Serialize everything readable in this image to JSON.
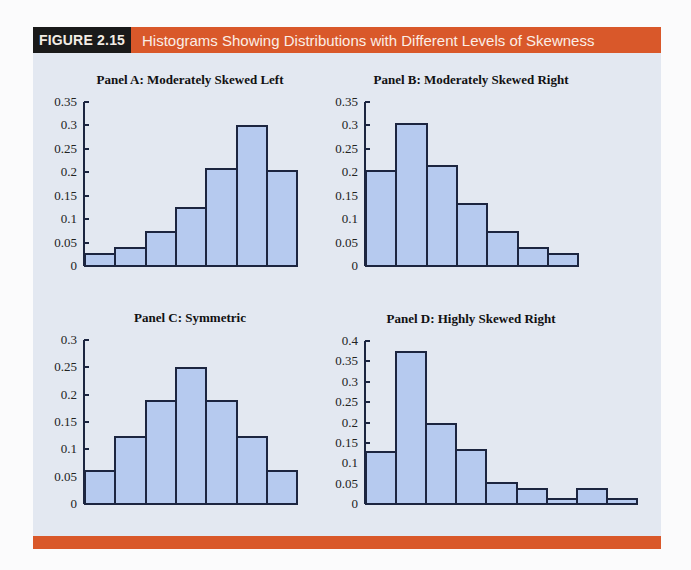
{
  "figure": {
    "label": "FIGURE 2.15",
    "title": "Histograms Showing Distributions with Different Levels of Skewness"
  },
  "colors": {
    "header_orange": "#d9582a",
    "label_black": "#1a1a1a",
    "panel_bg": "#e3e8f1",
    "bar_fill": "#b6caef",
    "bar_border": "#1c2540"
  },
  "chart_data": [
    {
      "type": "bar",
      "title": "Panel A: Moderately Skewed Left",
      "xlabel": "",
      "ylabel": "",
      "categories": [
        "1",
        "2",
        "3",
        "4",
        "5",
        "6",
        "7"
      ],
      "values": [
        0.028,
        0.04,
        0.075,
        0.125,
        0.21,
        0.3,
        0.205
      ],
      "ylim": [
        0,
        0.35
      ],
      "yticks": [
        "0",
        "0.05",
        "0.1",
        "0.15",
        "0.2",
        "0.25",
        "0.3",
        "0.35"
      ],
      "grid": false
    },
    {
      "type": "bar",
      "title": "Panel B: Moderately Skewed Right",
      "xlabel": "",
      "ylabel": "",
      "categories": [
        "1",
        "2",
        "3",
        "4",
        "5",
        "6",
        "7"
      ],
      "values": [
        0.205,
        0.305,
        0.215,
        0.135,
        0.075,
        0.04,
        0.028
      ],
      "ylim": [
        0,
        0.35
      ],
      "yticks": [
        "0",
        "0.05",
        "0.1",
        "0.15",
        "0.2",
        "0.25",
        "0.3",
        "0.35"
      ],
      "grid": false
    },
    {
      "type": "bar",
      "title": "Panel C: Symmetric",
      "xlabel": "",
      "ylabel": "",
      "categories": [
        "1",
        "2",
        "3",
        "4",
        "5",
        "6",
        "7"
      ],
      "values": [
        0.0625,
        0.125,
        0.19,
        0.25,
        0.19,
        0.125,
        0.0625
      ],
      "ylim": [
        0,
        0.3
      ],
      "yticks": [
        "0",
        "0.05",
        "0.1",
        "0.15",
        "0.2",
        "0.25",
        "0.3"
      ],
      "grid": false
    },
    {
      "type": "bar",
      "title": "Panel D: Highly Skewed Right",
      "xlabel": "",
      "ylabel": "",
      "categories": [
        "1",
        "2",
        "3",
        "4",
        "5",
        "6",
        "7",
        "8",
        "9"
      ],
      "values": [
        0.13,
        0.375,
        0.2,
        0.135,
        0.055,
        0.04,
        0.015,
        0.04,
        0.015
      ],
      "ylim": [
        0,
        0.4
      ],
      "yticks": [
        "0",
        "0.05",
        "0.1",
        "0.15",
        "0.2",
        "0.25",
        "0.3",
        "0.35",
        "0.4"
      ],
      "grid": false
    }
  ]
}
